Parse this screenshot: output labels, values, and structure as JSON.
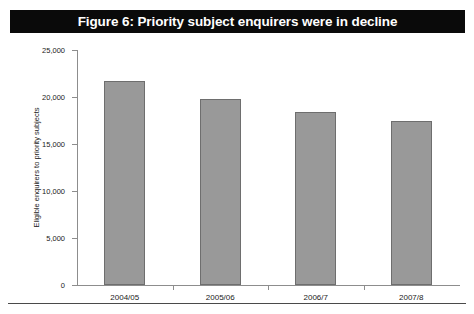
{
  "figure": {
    "title": "Figure 6: Priority subject enquirers were in decline",
    "title_bar_color": "#0a0a0a",
    "title_text_color": "#ffffff"
  },
  "chart_data": {
    "type": "bar",
    "title": "Figure 6: Priority subject enquirers were in decline",
    "subtitle": "",
    "xlabel": "",
    "ylabel": "Eligible enquirers to priority subjects",
    "categories": [
      "2004/05",
      "2005/06",
      "2006/7",
      "2007/8"
    ],
    "values": [
      21700,
      19800,
      18400,
      17400
    ],
    "ylim": [
      0,
      25000
    ],
    "yticks": [
      0,
      5000,
      10000,
      15000,
      20000,
      25000
    ],
    "ytick_labels": [
      "0",
      "5,000",
      "10,000",
      "15,000",
      "20,000",
      "25,000"
    ],
    "grid": false,
    "legend": false,
    "bar_color": "#999999",
    "bar_edge_color": "#6e6e6e",
    "axis_color": "#8d8d8d"
  }
}
